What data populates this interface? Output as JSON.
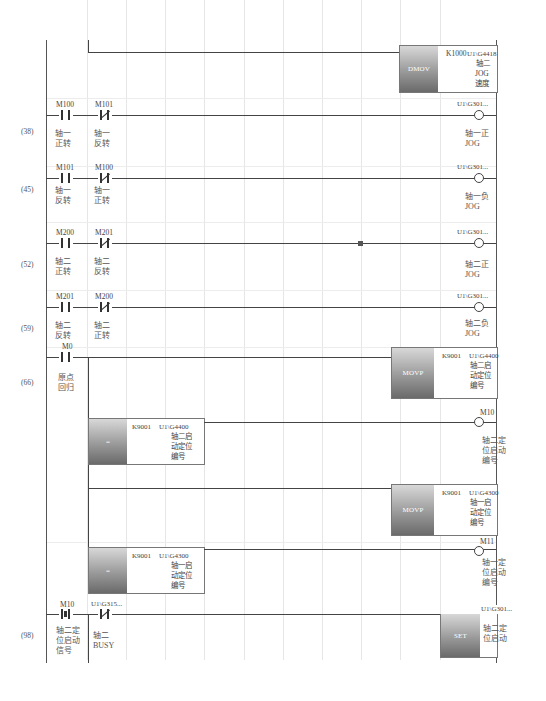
{
  "diagram": {
    "type": "ladder",
    "rungs": [
      {
        "step": "",
        "elements": [],
        "output": {
          "type": "instruction",
          "op": "DMOV",
          "args": [
            "K1000",
            "U1\\G4418"
          ],
          "comment": [
            "轴二",
            "JOG",
            "速度"
          ]
        }
      },
      {
        "step": "(38)",
        "contacts": [
          {
            "device": "M100",
            "kind": "NO",
            "comment": [
              "轴一",
              "正转"
            ]
          },
          {
            "device": "M101",
            "kind": "NC",
            "comment": [
              "轴一",
              "反转"
            ]
          }
        ],
        "output": {
          "type": "coil",
          "device": "U1\\G301...",
          "comment": [
            "轴一正",
            "JOG"
          ]
        }
      },
      {
        "step": "(45)",
        "contacts": [
          {
            "device": "M101",
            "kind": "NO",
            "comment": [
              "轴一",
              "反转"
            ]
          },
          {
            "device": "M100",
            "kind": "NC",
            "comment": [
              "轴一",
              "正转"
            ]
          }
        ],
        "output": {
          "type": "coil",
          "device": "U1\\G301...",
          "comment": [
            "轴一负",
            "JOG"
          ]
        }
      },
      {
        "step": "(52)",
        "contacts": [
          {
            "device": "M200",
            "kind": "NO",
            "comment": [
              "轴二",
              "正转"
            ]
          },
          {
            "device": "M201",
            "kind": "NC",
            "comment": [
              "轴二",
              "反转"
            ]
          }
        ],
        "output": {
          "type": "coil",
          "device": "U1\\G301...",
          "comment": [
            "轴二正",
            "JOG"
          ]
        }
      },
      {
        "step": "(59)",
        "contacts": [
          {
            "device": "M201",
            "kind": "NO",
            "comment": [
              "轴二",
              "反转"
            ]
          },
          {
            "device": "M200",
            "kind": "NC",
            "comment": [
              "轴二",
              "正转"
            ]
          }
        ],
        "output": {
          "type": "coil",
          "device": "U1\\G301...",
          "comment": [
            "轴二负",
            "JOG"
          ]
        }
      },
      {
        "step": "(66)",
        "contacts": [
          {
            "device": "M0",
            "kind": "NO",
            "comment": [
              "原点",
              "回归"
            ]
          }
        ],
        "branches": [
          {
            "output": {
              "type": "instruction",
              "op": "MOVP",
              "args": [
                "K9001",
                "U1\\G4400"
              ],
              "comment": [
                "轴二启",
                "动定位",
                "编号"
              ]
            }
          },
          {
            "compare": {
              "op": "=",
              "args": [
                "K9001",
                "U1\\G4400"
              ],
              "comment": [
                "轴二启",
                "动定位",
                "编号"
              ]
            },
            "output": {
              "type": "coil",
              "device": "M10",
              "comment": [
                "轴二定",
                "位启动",
                "编号"
              ]
            }
          },
          {
            "output": {
              "type": "instruction",
              "op": "MOVP",
              "args": [
                "K9001",
                "U1\\G4300"
              ],
              "comment": [
                "轴一启",
                "动定位",
                "编号"
              ]
            }
          },
          {
            "compare": {
              "op": "=",
              "args": [
                "K9001",
                "U1\\G4300"
              ],
              "comment": [
                "轴一启",
                "动定位",
                "编号"
              ]
            },
            "output": {
              "type": "coil",
              "device": "M11",
              "comment": [
                "轴一定",
                "位启动",
                "编号"
              ]
            }
          }
        ]
      },
      {
        "step": "(98)",
        "contacts": [
          {
            "device": "M10",
            "kind": "PLS",
            "comment": [
              "轴二定",
              "位启动",
              "信号"
            ]
          },
          {
            "device": "U1\\G315...",
            "kind": "NC",
            "comment": [
              "轴二",
              "BUSY"
            ]
          }
        ],
        "output": {
          "type": "instruction",
          "op": "SET",
          "args": [
            "U1\\G301..."
          ],
          "comment": [
            "轴二定",
            "位启动"
          ]
        }
      }
    ]
  },
  "labels": {
    "r0": {
      "op": "DMOV",
      "a1": "K1000",
      "a2": "U1\\G4418",
      "c1": "轴二",
      "c2": "JOG",
      "c3": "速度"
    },
    "r1": {
      "step": "(38)",
      "d1": "M100",
      "d2": "M101",
      "c1a": "轴一",
      "c1b": "正转",
      "c2a": "轴一",
      "c2b": "反转",
      "coil": "U1\\G301...",
      "oc1": "轴一正",
      "oc2": "JOG"
    },
    "r2": {
      "step": "(45)",
      "d1": "M101",
      "d2": "M100",
      "c1a": "轴一",
      "c1b": "反转",
      "c2a": "轴一",
      "c2b": "正转",
      "coil": "U1\\G301...",
      "oc1": "轴一负",
      "oc2": "JOG"
    },
    "r3": {
      "step": "(52)",
      "d1": "M200",
      "d2": "M201",
      "c1a": "轴二",
      "c1b": "正转",
      "c2a": "轴二",
      "c2b": "反转",
      "coil": "U1\\G301...",
      "oc1": "轴二正",
      "oc2": "JOG"
    },
    "r4": {
      "step": "(59)",
      "d1": "M201",
      "d2": "M200",
      "c1a": "轴二",
      "c1b": "反转",
      "c2a": "轴二",
      "c2b": "正转",
      "coil": "U1\\G301...",
      "oc1": "轴二负",
      "oc2": "JOG"
    },
    "r5": {
      "step": "(66)",
      "d1": "M0",
      "c1a": "原点",
      "c1b": "回归",
      "b1": {
        "op": "MOVP",
        "a1": "K9001",
        "a2": "U1\\G4400",
        "c1": "轴二启",
        "c2": "动定位",
        "c3": "编号"
      },
      "b2": {
        "op": "=",
        "a1": "K9001",
        "a2": "U1\\G4400",
        "c1": "轴二启",
        "c2": "动定位",
        "c3": "编号",
        "coil": "M10",
        "oc1": "轴二定",
        "oc2": "位启动",
        "oc3": "编号"
      },
      "b3": {
        "op": "MOVP",
        "a1": "K9001",
        "a2": "U1\\G4300",
        "c1": "轴一启",
        "c2": "动定位",
        "c3": "编号"
      },
      "b4": {
        "op": "=",
        "a1": "K9001",
        "a2": "U1\\G4300",
        "c1": "轴一启",
        "c2": "动定位",
        "c3": "编号",
        "coil": "M11",
        "oc1": "轴一定",
        "oc2": "位启动",
        "oc3": "编号"
      }
    },
    "r6": {
      "step": "(98)",
      "d1": "M10",
      "d2": "U1\\G315...",
      "c1a": "轴二定",
      "c1b": "位启动",
      "c1c": "信号",
      "c2a": "轴二",
      "c2b": "BUSY",
      "op": "SET",
      "a1": "U1\\G301...",
      "oc1": "轴二定",
      "oc2": "位启动"
    }
  },
  "colors": {
    "wire": "#444444",
    "grid": "#e6e6e6",
    "instruction_fill_top": "#d8d8d8",
    "instruction_fill_bottom": "#6a6a6a"
  }
}
